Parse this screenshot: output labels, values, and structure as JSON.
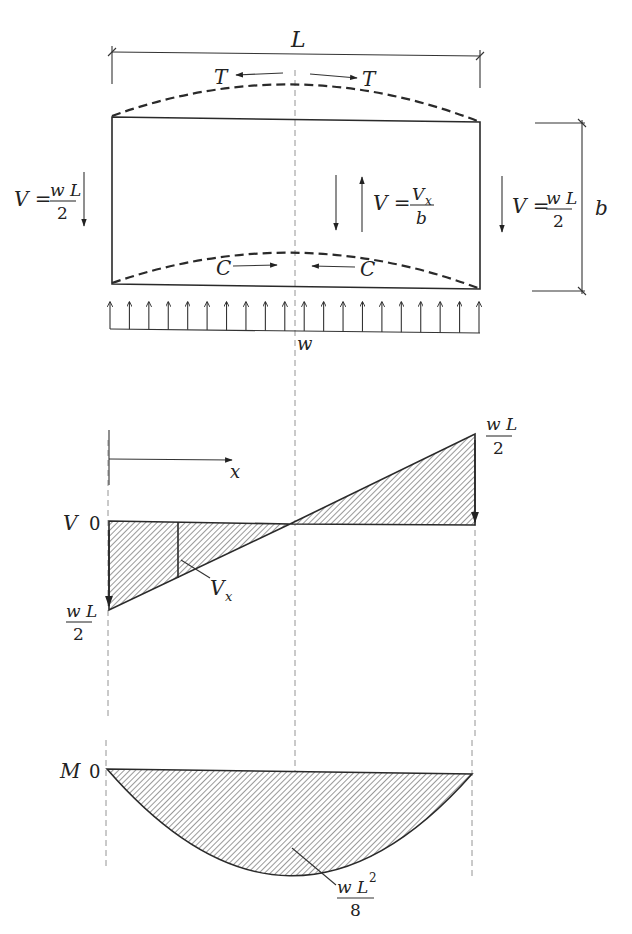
{
  "figure": {
    "span_label": "L",
    "depth_label": "b",
    "load_label": "w",
    "tension_label": "T",
    "compression_label": "C",
    "left_reaction": {
      "lhs": "V =",
      "num": "w L",
      "den": "2"
    },
    "right_reaction": {
      "lhs": "V =",
      "num": "w L",
      "den": "2"
    },
    "web_shear": {
      "lhs": "V =",
      "num": "V",
      "num_sub": "x",
      "den": "b"
    },
    "load_arrow_count": 20
  },
  "shear_diagram": {
    "axis_label": "V",
    "zero_label": "0",
    "x_label": "x",
    "vx_label": "V",
    "vx_sub": "x",
    "left_value": {
      "num": "w L",
      "den": "2"
    },
    "right_value": {
      "num": "w L",
      "den": "2"
    }
  },
  "moment_diagram": {
    "axis_label": "M",
    "zero_label": "0",
    "max_value": {
      "num": "w L",
      "exp": "2",
      "den": "8"
    }
  },
  "colors": {
    "line": "#2a2a2a",
    "hatch": "#555555",
    "centerline": "#888888",
    "background": "#ffffff"
  }
}
